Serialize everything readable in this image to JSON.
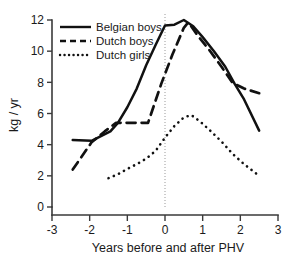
{
  "chart_data": {
    "type": "line",
    "title": "",
    "xlabel": "Years  before and after PHV",
    "ylabel": "kg / yr",
    "xlim": [
      -3,
      3
    ],
    "ylim": [
      0,
      12
    ],
    "xticks": [
      "-3",
      "-2",
      "-1",
      "0",
      "1",
      "2",
      "3"
    ],
    "xtick_values": [
      -3,
      -2,
      -1,
      0,
      1,
      2,
      3
    ],
    "yticks": [
      "0",
      "2",
      "4",
      "6",
      "8",
      "10",
      "12"
    ],
    "ytick_values": [
      0,
      2,
      4,
      6,
      8,
      10,
      12
    ],
    "grid": false,
    "legend_position": "top-left",
    "annotations": [
      {
        "name": "phv-reference-line",
        "type": "vertical-line",
        "x": 0,
        "style": "dotted"
      }
    ],
    "series": [
      {
        "name": "Belgian boys",
        "style": "solid",
        "color": "#111111",
        "x": [
          -2.45,
          -1.95,
          -1.45,
          -1.25,
          -1.0,
          -0.75,
          -0.5,
          -0.25,
          0.0,
          0.25,
          0.5,
          0.75,
          1.0,
          1.3,
          1.6,
          1.85,
          2.1,
          2.5
        ],
        "y": [
          4.3,
          4.25,
          4.85,
          5.4,
          6.4,
          7.6,
          9.1,
          10.4,
          11.65,
          11.7,
          12.0,
          11.6,
          10.9,
          10.0,
          9.0,
          7.9,
          6.9,
          4.9
        ]
      },
      {
        "name": "Dutch boys",
        "style": "dashed",
        "color": "#111111",
        "x": [
          -2.45,
          -1.95,
          -1.6,
          -1.3,
          -0.9,
          -0.45,
          -0.1,
          0.2,
          0.5,
          0.62,
          0.9,
          1.2,
          1.5,
          1.8,
          2.1,
          2.5
        ],
        "y": [
          2.4,
          4.15,
          4.85,
          5.4,
          5.4,
          5.4,
          7.9,
          9.8,
          11.5,
          11.85,
          10.9,
          10.0,
          9.0,
          7.95,
          7.6,
          7.3
        ]
      },
      {
        "name": "Dutch girls",
        "style": "dotted",
        "color": "#111111",
        "x": [
          -1.5,
          -1.25,
          -1.0,
          -0.75,
          -0.5,
          -0.25,
          0.0,
          0.25,
          0.5,
          0.7,
          0.95,
          1.2,
          1.5,
          1.8,
          2.1,
          2.5
        ],
        "y": [
          1.85,
          2.1,
          2.45,
          2.75,
          3.1,
          3.6,
          4.45,
          5.2,
          5.75,
          5.9,
          5.45,
          4.9,
          4.2,
          3.4,
          2.75,
          2.0
        ]
      }
    ]
  }
}
